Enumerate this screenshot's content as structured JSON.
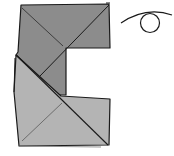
{
  "diagram": {
    "type": "origami-fold-step",
    "colors": {
      "paper_dark": "#8c8c8c",
      "paper_light": "#b4b4b4",
      "line": "#1a1a1a",
      "background": "#ffffff"
    },
    "symbols": [
      {
        "name": "turn-over-symbol",
        "meaning": "turn model over"
      }
    ]
  }
}
